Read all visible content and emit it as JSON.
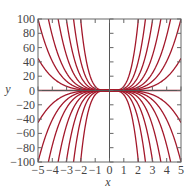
{
  "chart_data": {
    "type": "line",
    "title": "",
    "xlabel": "x",
    "ylabel": "y",
    "xlim": [
      -5,
      5
    ],
    "ylim": [
      -100,
      100
    ],
    "x_ticks": [
      -5,
      -4,
      -3,
      -2,
      -1,
      0,
      1,
      2,
      3,
      4,
      5
    ],
    "x_tick_labels": [
      "−5",
      "−4",
      "−3",
      "−2",
      "−1",
      "0",
      "1",
      "2",
      "3",
      "4",
      "5"
    ],
    "y_ticks": [
      -100,
      -80,
      -60,
      -40,
      -20,
      0,
      20,
      40,
      60,
      80,
      100
    ],
    "y_tick_labels": [
      "−100",
      "−80",
      "−60",
      "−40",
      "−20",
      "0",
      "20",
      "40",
      "60",
      "80",
      "100"
    ],
    "grid": false,
    "legend": null,
    "series_formula": "y = C·x^4",
    "series": [
      {
        "name": "C=0.072",
        "C": 0.072
      },
      {
        "name": "C=0.16",
        "C": 0.16
      },
      {
        "name": "C=0.3",
        "C": 0.3
      },
      {
        "name": "C=0.6",
        "C": 0.6
      },
      {
        "name": "C=1.2",
        "C": 1.2
      },
      {
        "name": "C=2.5",
        "C": 2.5
      },
      {
        "name": "C=6",
        "C": 6
      },
      {
        "name": "C=-0.072",
        "C": -0.072
      },
      {
        "name": "C=-0.16",
        "C": -0.16
      },
      {
        "name": "C=-0.3",
        "C": -0.3
      },
      {
        "name": "C=-0.6",
        "C": -0.6
      },
      {
        "name": "C=-1.2",
        "C": -1.2
      },
      {
        "name": "C=-2.5",
        "C": -2.5
      },
      {
        "name": "C=-6",
        "C": -6
      },
      {
        "name": "C=0",
        "C": 0
      }
    ],
    "line_color": "#a3182b",
    "axis_color": "#555555"
  }
}
